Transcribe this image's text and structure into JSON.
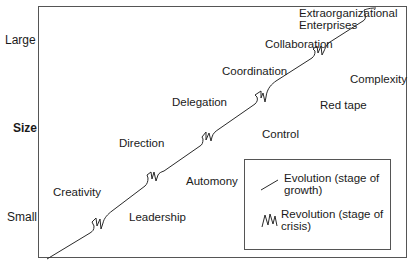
{
  "diagram": {
    "y_axis": {
      "title": "Size",
      "high_label": "Large",
      "low_label": "Small"
    },
    "evolution_stages": [
      {
        "label": "Creativity"
      },
      {
        "label": "Direction"
      },
      {
        "label": "Delegation"
      },
      {
        "label": "Coordination"
      },
      {
        "label": "Collaboration"
      },
      {
        "label": "Extraorganizational Enterprises"
      }
    ],
    "revolution_crises": [
      {
        "label": "Leadership"
      },
      {
        "label": "Automony"
      },
      {
        "label": "Control"
      },
      {
        "label": "Red tape"
      },
      {
        "label": "Complexity"
      }
    ],
    "legend": {
      "evolution": {
        "line1": "Evolution (stage of",
        "line2": "growth)"
      },
      "revolution": {
        "line1": "Revolution (stage of",
        "line2": "crisis)"
      }
    },
    "colors": {
      "line": "#2a2a2a",
      "border": "#555555",
      "text": "#1a1a1a"
    }
  }
}
